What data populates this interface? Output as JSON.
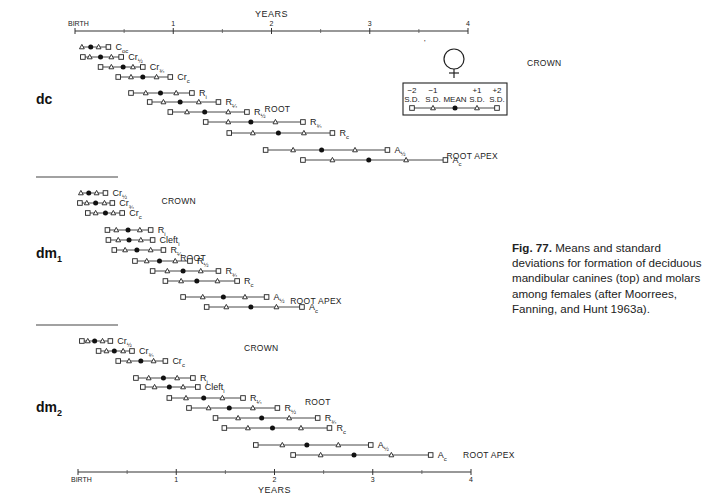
{
  "chart_data": {
    "type": "range-plot",
    "title": "Fig. 77. Means and standard deviations for formation of deciduous mandibular canines (top) and molars among females (after Moorrees, Fanning, and Hunt 1963a).",
    "xlabel": "YEARS",
    "ylabel": "",
    "xlim": [
      0,
      4
    ],
    "x_ticks": [
      {
        "value": 0,
        "label": "BIRTH"
      },
      {
        "value": 1,
        "label": "1"
      },
      {
        "value": 2,
        "label": "2"
      },
      {
        "value": 3,
        "label": "3"
      },
      {
        "value": 4,
        "label": "4"
      }
    ],
    "minor_ticks": [
      0.5,
      1.5,
      2.5,
      3.5
    ],
    "legend": {
      "symbol": "female",
      "entries": [
        {
          "label": "-2 S.D.",
          "marker": "square"
        },
        {
          "label": "-1 S.D.",
          "marker": "triangle"
        },
        {
          "label": "MEAN",
          "marker": "filled-circle"
        },
        {
          "label": "+1 S.D.",
          "marker": "triangle"
        },
        {
          "label": "+2 S.D.",
          "marker": "square"
        }
      ]
    },
    "point_order": [
      "-2 S.D.",
      "-1 S.D.",
      "MEAN",
      "+1 S.D.",
      "+2 S.D."
    ],
    "groups": [
      {
        "name": "dc",
        "label_main": "dc",
        "label_sub": "",
        "phases": [
          {
            "label": "CROWN",
            "x": 4.6,
            "y": 66
          },
          {
            "label": "ROOT",
            "x": 1.93,
            "y": 112
          },
          {
            "label": "ROOT APEX",
            "x": 3.78,
            "y": 159
          }
        ],
        "stages": [
          {
            "stage": "Coc",
            "main": "C",
            "sub": "oc",
            "y": 47,
            "values": [
              null,
              0.07,
              0.16,
              0.24,
              0.34
            ]
          },
          {
            "stage": "Cr1/2",
            "main": "Cr",
            "sub": "½",
            "y": 57,
            "values": [
              0.08,
              0.15,
              0.26,
              0.37,
              0.47
            ]
          },
          {
            "stage": "Cr3/4",
            "main": "Cr",
            "sub": "¾",
            "y": 67,
            "values": [
              0.26,
              0.37,
              0.49,
              0.59,
              0.69
            ]
          },
          {
            "stage": "Crc",
            "main": "Cr",
            "sub": "c",
            "y": 77,
            "values": [
              0.44,
              0.57,
              0.69,
              0.83,
              0.97
            ]
          },
          {
            "stage": "Ri",
            "main": "R",
            "sub": "i",
            "y": 93,
            "values": [
              0.57,
              0.72,
              0.87,
              1.03,
              1.19
            ]
          },
          {
            "stage": "R1/4",
            "main": "R",
            "sub": "¼",
            "y": 102,
            "values": [
              0.76,
              0.9,
              1.07,
              1.26,
              1.46
            ]
          },
          {
            "stage": "R1/2",
            "main": "R",
            "sub": "½",
            "y": 112,
            "values": [
              0.97,
              1.14,
              1.32,
              1.56,
              1.75
            ]
          },
          {
            "stage": "R3/4",
            "main": "R",
            "sub": "¾",
            "y": 122,
            "values": [
              1.33,
              1.56,
              1.79,
              2.04,
              2.32
            ]
          },
          {
            "stage": "Rc",
            "main": "R",
            "sub": "c",
            "y": 133,
            "values": [
              1.57,
              1.81,
              2.07,
              2.33,
              2.62
            ]
          },
          {
            "stage": "A1/2",
            "main": "A",
            "sub": "½",
            "y": 150,
            "values": [
              1.94,
              2.22,
              2.51,
              2.85,
              3.18
            ]
          },
          {
            "stage": "Ac",
            "main": "A",
            "sub": "c",
            "y": 160,
            "values": [
              2.32,
              2.62,
              2.99,
              3.37,
              3.77
            ]
          }
        ]
      },
      {
        "name": "dm1",
        "label_main": "dm",
        "label_sub": "1",
        "phases": [
          {
            "label": "CROWN",
            "x": 0.88,
            "y": 204
          },
          {
            "label": "ROOT",
            "x": 1.07,
            "y": 261
          },
          {
            "label": "ROOT APEX",
            "x": 2.19,
            "y": 304
          }
        ],
        "stages": [
          {
            "stage": "Cr1/2",
            "main": "Cr",
            "sub": "½",
            "y": 193,
            "values": [
              null,
              0.06,
              0.14,
              0.22,
              0.31
            ]
          },
          {
            "stage": "Cr3/4",
            "main": "Cr",
            "sub": "¾",
            "y": 203,
            "values": [
              0.05,
              0.12,
              0.21,
              0.3,
              0.38
            ]
          },
          {
            "stage": "Crc",
            "main": "Cr",
            "sub": "c",
            "y": 213,
            "values": [
              0.13,
              0.21,
              0.31,
              0.39,
              0.48
            ]
          },
          {
            "stage": "Ri",
            "main": "R",
            "sub": "i",
            "y": 230,
            "values": [
              0.33,
              0.42,
              0.54,
              0.66,
              0.77
            ]
          },
          {
            "stage": "Cleft i",
            "main": "Cleft",
            "sub": "i",
            "y": 240,
            "values": [
              0.34,
              0.44,
              0.55,
              0.67,
              0.79
            ]
          },
          {
            "stage": "R1/4",
            "main": "R",
            "sub": "¼",
            "y": 250,
            "values": [
              0.4,
              0.51,
              0.63,
              0.77,
              0.9
            ]
          },
          {
            "stage": "R1/2",
            "main": "R",
            "sub": "½",
            "y": 261,
            "values": [
              0.61,
              0.73,
              0.86,
              1.02,
              1.17
            ]
          },
          {
            "stage": "R3/4",
            "main": "R",
            "sub": "¾",
            "y": 271,
            "values": [
              0.79,
              0.94,
              1.1,
              1.28,
              1.46
            ]
          },
          {
            "stage": "Rc",
            "main": "R",
            "sub": "c",
            "y": 281,
            "values": [
              0.92,
              1.08,
              1.24,
              1.45,
              1.65
            ]
          },
          {
            "stage": "A1/2",
            "main": "A",
            "sub": "½",
            "y": 297,
            "values": [
              1.1,
              1.3,
              1.51,
              1.73,
              1.95
            ]
          },
          {
            "stage": "Ac",
            "main": "A",
            "sub": "c",
            "y": 307,
            "values": [
              1.34,
              1.54,
              1.79,
              2.05,
              2.31
            ]
          }
        ]
      },
      {
        "name": "dm2",
        "label_main": "dm",
        "label_sub": "2",
        "phases": [
          {
            "label": "CROWN",
            "x": 1.72,
            "y": 351
          },
          {
            "label": "ROOT",
            "x": 2.34,
            "y": 405
          },
          {
            "label": "ROOT APEX",
            "x": 3.95,
            "y": 458
          }
        ],
        "stages": [
          {
            "stage": "Cr1/2",
            "main": "Cr",
            "sub": "½",
            "y": 341,
            "values": [
              0.07,
              0.13,
              0.2,
              0.28,
              0.36
            ]
          },
          {
            "stage": "Cr3/4",
            "main": "Cr",
            "sub": "¾",
            "y": 351,
            "values": [
              0.24,
              0.32,
              0.4,
              0.49,
              0.58
            ]
          },
          {
            "stage": "Crc",
            "main": "Cr",
            "sub": "c",
            "y": 361,
            "values": [
              0.44,
              0.55,
              0.67,
              0.8,
              0.92
            ]
          },
          {
            "stage": "Ri",
            "main": "R",
            "sub": "i",
            "y": 378,
            "values": [
              0.62,
              0.75,
              0.9,
              1.04,
              1.2
            ]
          },
          {
            "stage": "Cleft i",
            "main": "Cleft",
            "sub": "i",
            "y": 387,
            "values": [
              0.69,
              0.81,
              0.96,
              1.1,
              1.25
            ]
          },
          {
            "stage": "R1/4",
            "main": "R",
            "sub": "¼",
            "y": 398,
            "values": [
              0.96,
              1.13,
              1.31,
              1.5,
              1.71
            ]
          },
          {
            "stage": "R1/2",
            "main": "R",
            "sub": "½",
            "y": 408,
            "values": [
              1.16,
              1.36,
              1.57,
              1.81,
              2.06
            ]
          },
          {
            "stage": "R3/4",
            "main": "R",
            "sub": "¾",
            "y": 418,
            "values": [
              1.43,
              1.66,
              1.9,
              2.18,
              2.47
            ]
          },
          {
            "stage": "Rc",
            "main": "R",
            "sub": "c",
            "y": 428,
            "values": [
              1.52,
              1.76,
              2.01,
              2.3,
              2.59
            ]
          },
          {
            "stage": "A1/2",
            "main": "A",
            "sub": "½",
            "y": 445,
            "values": [
              1.84,
              2.11,
              2.36,
              2.68,
              3.01
            ]
          },
          {
            "stage": "Ac",
            "main": "A",
            "sub": "c",
            "y": 455,
            "values": [
              2.22,
              2.5,
              2.84,
              3.22,
              3.62
            ]
          }
        ]
      }
    ]
  },
  "layout": {
    "top_axis": {
      "y": 31,
      "x0": 75,
      "x4": 468,
      "title": "YEARS"
    },
    "bottom_axis": {
      "y": 472,
      "x0": 78,
      "x4": 471,
      "title": "YEARS"
    },
    "group_labels": [
      {
        "x": 36,
        "y": 104
      },
      {
        "x": 36,
        "y": 258
      },
      {
        "x": 36,
        "y": 412
      }
    ],
    "separators": [
      {
        "x1": 36,
        "x2": 118,
        "y": 177
      },
      {
        "x1": 36,
        "x2": 118,
        "y": 325
      }
    ]
  },
  "caption": {
    "fig_label": "Fig. 77.",
    "text": " Means and standard deviations for formation of deciduous mandibular canines (top) and molars among females (after Moorrees, Fanning, and Hunt 1963a)."
  },
  "legend_box": {
    "labels_top": [
      "−2",
      "−1",
      "",
      "+1",
      "+2"
    ],
    "labels_bottom": [
      "S.D.",
      "S.D.",
      "MEAN",
      "S.D.",
      "S.D."
    ]
  }
}
